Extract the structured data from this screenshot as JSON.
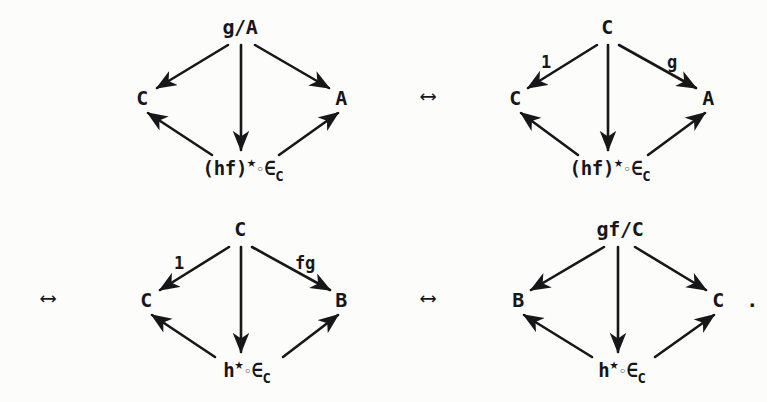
{
  "page": {
    "width": 767,
    "height": 402,
    "background_color": "#fcfcfa",
    "ink_color": "#17171a",
    "trailing_punctuation": "."
  },
  "equivalence_arrows": [
    {
      "name": "arrow-top-middle",
      "glyph": "⟷",
      "x": 428,
      "y": 96
    },
    {
      "name": "arrow-bottom-left",
      "glyph": "⟷",
      "x": 48,
      "y": 298
    },
    {
      "name": "arrow-bottom-middle",
      "glyph": "⟷",
      "x": 428,
      "y": 298
    }
  ],
  "diagrams": [
    {
      "id": "diagram-1",
      "position": "top-left",
      "apex": {
        "label": "g/A",
        "x": 240,
        "y": 27
      },
      "left": {
        "label": "C",
        "x": 142,
        "y": 98
      },
      "right": {
        "label": "A",
        "x": 341,
        "y": 98
      },
      "bottom": {
        "base": "(hf)",
        "star": "★",
        "ring": "◦",
        "member": "∈",
        "subscript": "C",
        "x": 243,
        "y": 168
      },
      "edge_labels": {
        "left": "",
        "right": ""
      }
    },
    {
      "id": "diagram-2",
      "position": "top-right",
      "apex": {
        "label": "C",
        "x": 607,
        "y": 27
      },
      "left": {
        "label": "C",
        "x": 515,
        "y": 98
      },
      "right": {
        "label": "A",
        "x": 708,
        "y": 98
      },
      "bottom": {
        "base": "(hf)",
        "star": "★",
        "ring": "◦",
        "member": "∈",
        "subscript": "C",
        "x": 610,
        "y": 168
      },
      "edge_labels": {
        "left": "1",
        "right": "g"
      }
    },
    {
      "id": "diagram-3",
      "position": "bottom-left",
      "apex": {
        "label": "C",
        "x": 240,
        "y": 229
      },
      "left": {
        "label": "C",
        "x": 146,
        "y": 300
      },
      "right": {
        "label": "B",
        "x": 341,
        "y": 300
      },
      "bottom": {
        "base": "h",
        "star": "★",
        "ring": "◦",
        "member": "∈",
        "subscript": "C",
        "x": 247,
        "y": 370
      },
      "edge_labels": {
        "left": "1",
        "right": "fg"
      }
    },
    {
      "id": "diagram-4",
      "position": "bottom-right",
      "apex": {
        "label": "gf/C",
        "x": 620,
        "y": 229
      },
      "left": {
        "label": "B",
        "x": 518,
        "y": 300
      },
      "right": {
        "label": "C",
        "x": 718,
        "y": 300
      },
      "bottom": {
        "base": "h",
        "star": "★",
        "ring": "◦",
        "member": "∈",
        "subscript": "C",
        "x": 622,
        "y": 370
      },
      "edge_labels": {
        "left": "",
        "right": ""
      }
    }
  ],
  "edge_label_positions": {
    "diagram-2": {
      "left": {
        "x": 546,
        "y": 62
      },
      "right": {
        "x": 672,
        "y": 62
      }
    },
    "diagram-3": {
      "left": {
        "x": 179,
        "y": 263
      },
      "right": {
        "x": 305,
        "y": 263
      }
    }
  },
  "trailing_period": {
    "x": 752,
    "y": 300
  }
}
